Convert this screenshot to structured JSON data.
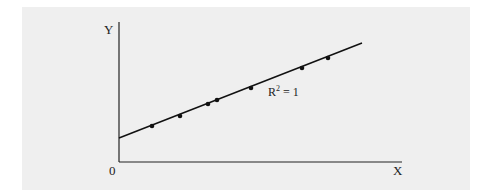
{
  "chart_data": {
    "type": "scatter",
    "title": "",
    "xlabel": "X",
    "ylabel": "Y",
    "origin_label": "0",
    "annotation": "R² = 1",
    "annotation_base": "R",
    "annotation_sup": "2",
    "annotation_rest": " = 1",
    "grid": false,
    "points_px": [
      [
        152,
        126
      ],
      [
        180,
        116
      ],
      [
        208,
        104
      ],
      [
        217,
        100
      ],
      [
        251,
        88
      ],
      [
        302,
        68
      ],
      [
        328,
        58
      ]
    ],
    "fit_line": {
      "type": "linear",
      "r_squared": 1
    }
  },
  "axes": {
    "x_label": "X",
    "y_label": "Y",
    "origin": "0"
  }
}
